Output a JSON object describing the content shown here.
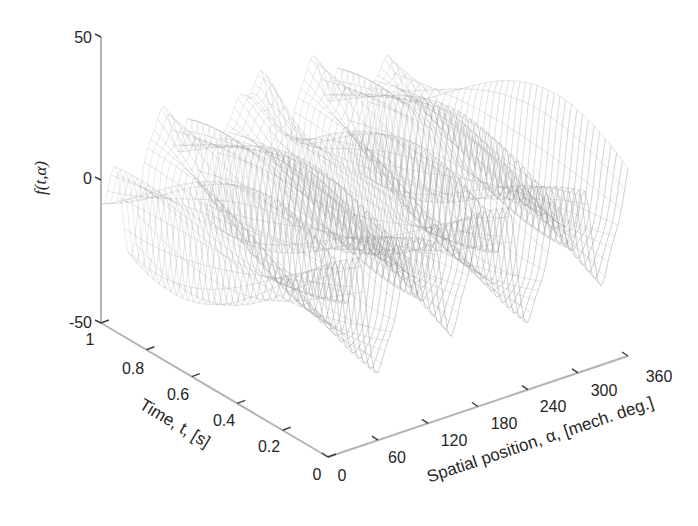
{
  "chart_data": {
    "type": "surface",
    "style": "mesh-wireframe",
    "title": "",
    "xlabel": "Spatial position, α, [mech. deg.]",
    "ylabel": "Time, t, [s]",
    "zlabel": "f(t,α)",
    "x": {
      "name": "alpha",
      "ticks": [
        0,
        60,
        120,
        180,
        240,
        300,
        360
      ],
      "lim": [
        0,
        360
      ]
    },
    "y": {
      "name": "t",
      "ticks": [
        0,
        0.2,
        0.4,
        0.6,
        0.8,
        1
      ],
      "lim": [
        0,
        1
      ]
    },
    "z": {
      "ticks": [
        -50,
        0,
        50
      ],
      "lim": [
        -50,
        50
      ]
    },
    "grid": false,
    "legend": null,
    "surface_description": "Wavy wireframe surface; values range roughly -40 to +45; ridges along t near alpha≈60, 170, 260, 345; troughs near alpha≈30, 100, 215, 305; peak ~+45 near alpha≈180, t≈1",
    "mesh_color": "#8c8c8c"
  },
  "labels": {
    "z_ticks": [
      "50",
      "0",
      "-50"
    ],
    "t_ticks": [
      "1",
      "0.8",
      "0.6",
      "0.4",
      "0.2",
      "0"
    ],
    "a_ticks": [
      "0",
      "60",
      "120",
      "180",
      "240",
      "300",
      "360"
    ],
    "z_title": "f(t,α)",
    "t_title": "Time, t, [s]",
    "a_title": "Spatial position, α, [mech. deg.]"
  }
}
